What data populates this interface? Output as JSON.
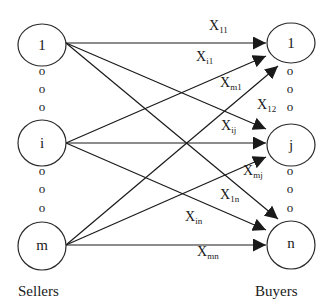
{
  "colors": {
    "stroke": "#1a1a1a",
    "background": "#ffffff"
  },
  "sellers": {
    "label": "Sellers",
    "nodes": [
      {
        "id": "s1",
        "label": "1",
        "cx": 42,
        "cy": 45
      },
      {
        "id": "si",
        "label": "i",
        "cx": 42,
        "cy": 143
      },
      {
        "id": "sm",
        "label": "m",
        "cx": 42,
        "cy": 246
      }
    ],
    "ellipsis": [
      "o",
      "o",
      "o",
      "o",
      "o",
      "o"
    ]
  },
  "buyers": {
    "label": "Buyers",
    "nodes": [
      {
        "id": "b1",
        "label": "1",
        "cx": 291,
        "cy": 43
      },
      {
        "id": "bj",
        "label": "j",
        "cx": 291,
        "cy": 145
      },
      {
        "id": "bn",
        "label": "n",
        "cx": 291,
        "cy": 245
      }
    ],
    "ellipsis": [
      "o",
      "o",
      "o",
      "o",
      "o",
      "o"
    ]
  },
  "edges": [
    {
      "from": "1",
      "to": "1",
      "label": "X",
      "sub": "11"
    },
    {
      "from": "i",
      "to": "1",
      "label": "X",
      "sub": "i1"
    },
    {
      "from": "m",
      "to": "1",
      "label": "X",
      "sub": "m1"
    },
    {
      "from": "1",
      "to": "j",
      "label": "X",
      "sub": "12"
    },
    {
      "from": "i",
      "to": "j",
      "label": "X",
      "sub": "ij"
    },
    {
      "from": "m",
      "to": "j",
      "label": "X",
      "sub": "mj"
    },
    {
      "from": "1",
      "to": "n",
      "label": "X",
      "sub": "1n"
    },
    {
      "from": "i",
      "to": "n",
      "label": "X",
      "sub": "in"
    },
    {
      "from": "m",
      "to": "n",
      "label": "X",
      "sub": "mn"
    }
  ]
}
